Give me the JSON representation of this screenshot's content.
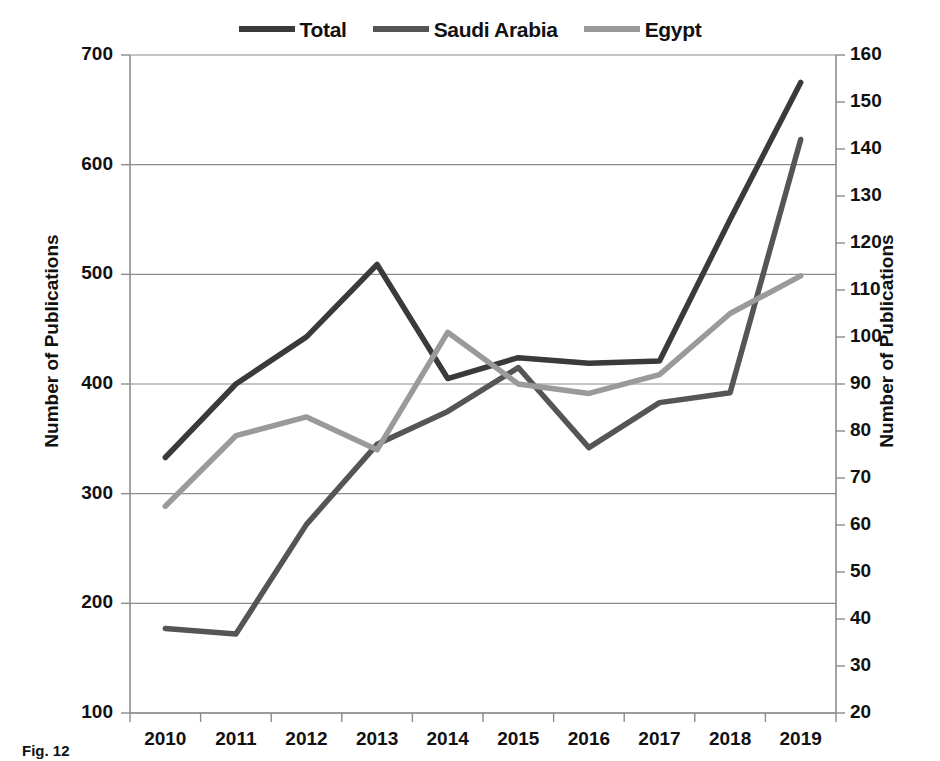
{
  "chart_data": {
    "type": "line",
    "title": "",
    "xlabel": "",
    "ylabel": "Number of Publications",
    "ylabel_secondary": "Number of Publications",
    "x": [
      2010,
      2011,
      2012,
      2013,
      2014,
      2015,
      2016,
      2017,
      2018,
      2019
    ],
    "xtick_labels": [
      "2010",
      "2011",
      "2012",
      "2013",
      "2014",
      "2015",
      "2016",
      "2017",
      "2018",
      "2019"
    ],
    "ylim": [
      100,
      700
    ],
    "ytick_labels": [
      "100",
      "200",
      "300",
      "400",
      "500",
      "600",
      "700"
    ],
    "yticks": [
      100,
      200,
      300,
      400,
      500,
      600,
      700
    ],
    "ylim_secondary": [
      20,
      160
    ],
    "ytick_labels_secondary": [
      "20",
      "30",
      "40",
      "50",
      "60",
      "70",
      "80",
      "90",
      "100",
      "110",
      "120",
      "130",
      "140",
      "150",
      "160"
    ],
    "yticks_secondary": [
      20,
      30,
      40,
      50,
      60,
      70,
      80,
      90,
      100,
      110,
      120,
      130,
      140,
      150,
      160
    ],
    "grid": true,
    "grid_axis": "y",
    "legend_position": "top-center",
    "series": [
      {
        "name": "Total",
        "axis": "left",
        "color": "#3a3a3a",
        "values": [
          333,
          400,
          443,
          509,
          405,
          424,
          419,
          421,
          550,
          675
        ]
      },
      {
        "name": "Saudi Arabia",
        "axis": "left",
        "color": "#555555",
        "values": [
          177,
          172,
          272,
          345,
          375,
          415,
          342,
          383,
          392,
          623
        ]
      },
      {
        "name": "Egypt",
        "axis": "right",
        "color": "#9a9a9a",
        "values": [
          64,
          79,
          83,
          76,
          101,
          90,
          88,
          92,
          105,
          113
        ]
      }
    ]
  },
  "legend": {
    "items": [
      {
        "label": "Total",
        "color": "#3a3a3a"
      },
      {
        "label": "Saudi Arabia",
        "color": "#555555"
      },
      {
        "label": "Egypt",
        "color": "#9a9a9a"
      }
    ]
  },
  "axes": {
    "left_title": "Number of Publications",
    "right_title": "Number of Publications"
  },
  "caption": {
    "text": "Fig. 12"
  },
  "colors": {
    "total": "#3a3a3a",
    "saudi_arabia": "#555555",
    "egypt": "#9a9a9a",
    "grid": "#8c8c8c",
    "axis": "#8c8c8c",
    "text": "#111111",
    "background": "#ffffff"
  }
}
